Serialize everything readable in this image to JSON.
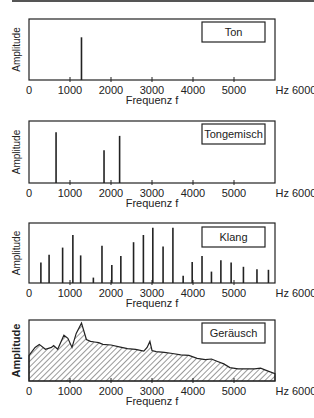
{
  "chart_data": [
    {
      "type": "bar",
      "title": "Ton",
      "xlabel": "Frequenz f",
      "ylabel": "Amplitude",
      "xlim": [
        0,
        6000
      ],
      "x_unit": "Hz",
      "xticks": [
        "0",
        "1000",
        "2000",
        "3000",
        "4000",
        "5000",
        "Hz 6000"
      ],
      "x": [
        1280
      ],
      "values": [
        0.7
      ]
    },
    {
      "type": "bar",
      "title": "Tongemisch",
      "xlabel": "Frequenz f",
      "ylabel": "Amplitude",
      "xlim": [
        0,
        6000
      ],
      "x_unit": "Hz",
      "xticks": [
        "0",
        "1000",
        "2000",
        "3000",
        "4000",
        "5000",
        "Hz 6000"
      ],
      "x": [
        660,
        1830,
        2210
      ],
      "values": [
        0.82,
        0.53,
        0.76
      ]
    },
    {
      "type": "bar",
      "title": "Klang",
      "xlabel": "Frequenz f",
      "ylabel": "Amplitude",
      "xlim": [
        0,
        6000
      ],
      "x_unit": "Hz",
      "xticks": [
        "0",
        "1000",
        "2000",
        "3000",
        "4000",
        "5000",
        "Hz 6000"
      ],
      "x": [
        290,
        490,
        820,
        1070,
        1260,
        1570,
        1780,
        2020,
        2240,
        2550,
        2790,
        3020,
        3270,
        3510,
        3760,
        3980,
        4220,
        4450,
        4680,
        4930,
        5230,
        5560,
        5840
      ],
      "values": [
        0.34,
        0.47,
        0.59,
        0.8,
        0.46,
        0.09,
        0.62,
        0.3,
        0.45,
        0.68,
        0.8,
        0.92,
        0.61,
        0.92,
        0.12,
        0.35,
        0.45,
        0.19,
        0.38,
        0.34,
        0.27,
        0.23,
        0.22
      ]
    },
    {
      "type": "area",
      "title": "Geräusch",
      "xlabel": "Frequenz f",
      "ylabel": "Amplitude",
      "xlim": [
        0,
        6000
      ],
      "x_unit": "Hz",
      "xticks": [
        "0",
        "1000",
        "2000",
        "3000",
        "4000",
        "5000",
        "Hz 6000"
      ],
      "fill": "hatched",
      "x": [
        0,
        150,
        250,
        400,
        550,
        600,
        700,
        850,
        950,
        1050,
        1150,
        1280,
        1400,
        1500,
        1600,
        1700,
        1800,
        2000,
        2200,
        2400,
        2600,
        2800,
        2880,
        2950,
        3000,
        3100,
        3300,
        3500,
        3700,
        3900,
        4100,
        4300,
        4450,
        4600,
        4750,
        4900,
        5100,
        5300,
        5500,
        5650,
        5800,
        6000
      ],
      "values": [
        0.42,
        0.55,
        0.6,
        0.52,
        0.55,
        0.58,
        0.52,
        0.75,
        0.7,
        0.55,
        0.78,
        0.95,
        0.68,
        0.65,
        0.64,
        0.63,
        0.6,
        0.59,
        0.56,
        0.53,
        0.52,
        0.49,
        0.55,
        0.65,
        0.5,
        0.48,
        0.47,
        0.45,
        0.43,
        0.42,
        0.37,
        0.35,
        0.36,
        0.32,
        0.28,
        0.22,
        0.2,
        0.2,
        0.2,
        0.21,
        0.17,
        0.12
      ]
    }
  ]
}
